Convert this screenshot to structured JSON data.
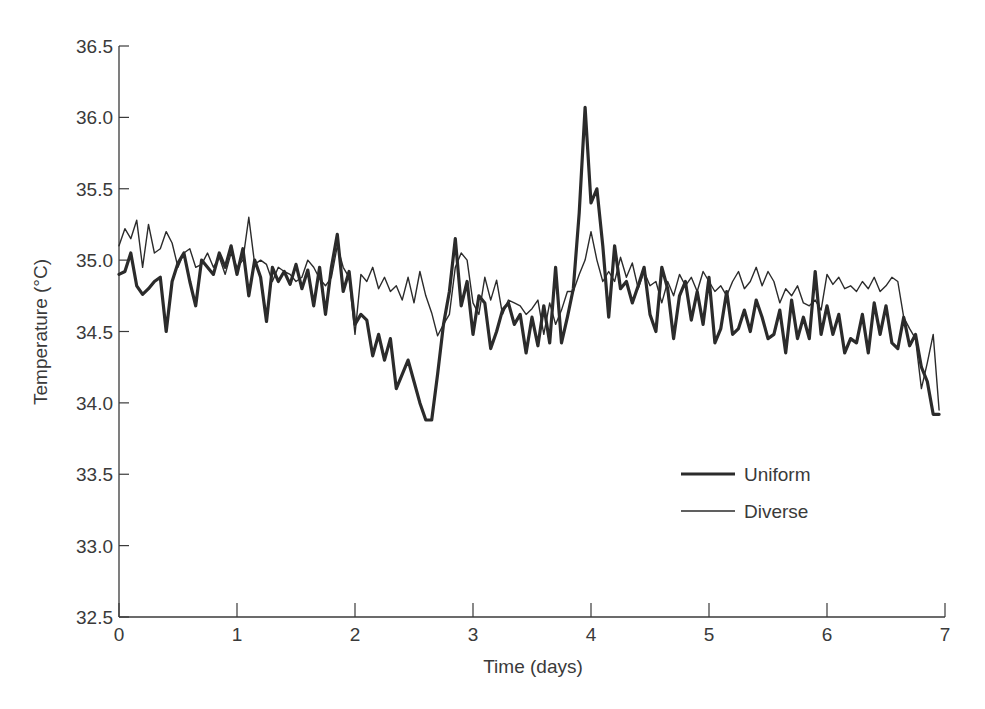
{
  "chart_data": {
    "type": "line",
    "title": "",
    "xlabel": "Time (days)",
    "ylabel": "Temperature (°C)",
    "xlim": [
      0,
      7
    ],
    "ylim": [
      32.5,
      36.5
    ],
    "xticks": [
      0,
      1,
      2,
      3,
      4,
      5,
      6,
      7
    ],
    "yticks": [
      32.5,
      33.0,
      33.5,
      34.0,
      34.5,
      35.0,
      35.5,
      36.0,
      36.5
    ],
    "ytick_labels": [
      "32.5",
      "33.0",
      "33.5",
      "34.0",
      "34.5",
      "35.0",
      "35.5",
      "36.0",
      "36.5"
    ],
    "grid": false,
    "legend_position": "lower right (inside plot)",
    "series": [
      {
        "name": "Uniform",
        "style": "thick",
        "color": "#2b2b2b",
        "x": [
          0.0,
          0.05,
          0.1,
          0.15,
          0.2,
          0.25,
          0.3,
          0.35,
          0.4,
          0.45,
          0.5,
          0.55,
          0.6,
          0.65,
          0.7,
          0.75,
          0.8,
          0.85,
          0.9,
          0.95,
          1.0,
          1.05,
          1.1,
          1.15,
          1.2,
          1.25,
          1.3,
          1.35,
          1.4,
          1.45,
          1.5,
          1.55,
          1.6,
          1.65,
          1.7,
          1.75,
          1.8,
          1.85,
          1.9,
          1.95,
          2.0,
          2.05,
          2.1,
          2.15,
          2.2,
          2.25,
          2.3,
          2.35,
          2.4,
          2.45,
          2.5,
          2.55,
          2.6,
          2.65,
          2.7,
          2.75,
          2.8,
          2.85,
          2.9,
          2.95,
          3.0,
          3.05,
          3.1,
          3.15,
          3.2,
          3.25,
          3.3,
          3.35,
          3.4,
          3.45,
          3.5,
          3.55,
          3.6,
          3.65,
          3.7,
          3.75,
          3.8,
          3.85,
          3.9,
          3.95,
          4.0,
          4.05,
          4.1,
          4.15,
          4.2,
          4.25,
          4.3,
          4.35,
          4.4,
          4.45,
          4.5,
          4.55,
          4.6,
          4.65,
          4.7,
          4.75,
          4.8,
          4.85,
          4.9,
          4.95,
          5.0,
          5.05,
          5.1,
          5.15,
          5.2,
          5.25,
          5.3,
          5.35,
          5.4,
          5.45,
          5.5,
          5.55,
          5.6,
          5.65,
          5.7,
          5.75,
          5.8,
          5.85,
          5.9,
          5.95,
          6.0,
          6.05,
          6.1,
          6.15,
          6.2,
          6.25,
          6.3,
          6.35,
          6.4,
          6.45,
          6.5,
          6.55,
          6.6,
          6.65,
          6.7,
          6.75,
          6.8,
          6.85,
          6.9,
          6.95
        ],
        "y": [
          34.9,
          34.92,
          35.05,
          34.82,
          34.76,
          34.8,
          34.85,
          34.88,
          34.5,
          34.85,
          34.98,
          35.05,
          34.85,
          34.68,
          35.0,
          34.95,
          34.9,
          35.05,
          34.95,
          35.1,
          34.9,
          35.08,
          34.75,
          35.0,
          34.88,
          34.57,
          34.95,
          34.85,
          34.92,
          34.83,
          34.97,
          34.8,
          34.93,
          34.68,
          34.95,
          34.62,
          34.95,
          35.18,
          34.78,
          34.92,
          34.55,
          34.62,
          34.58,
          34.33,
          34.48,
          34.3,
          34.45,
          34.1,
          34.2,
          34.3,
          34.15,
          34.0,
          33.88,
          33.88,
          34.2,
          34.55,
          34.78,
          35.15,
          34.68,
          34.85,
          34.48,
          34.75,
          34.7,
          34.38,
          34.5,
          34.65,
          34.7,
          34.55,
          34.62,
          34.35,
          34.6,
          34.4,
          34.68,
          34.42,
          34.95,
          34.42,
          34.6,
          34.8,
          35.33,
          36.07,
          35.4,
          35.5,
          35.1,
          34.6,
          35.1,
          34.8,
          34.85,
          34.7,
          34.82,
          34.95,
          34.62,
          34.5,
          34.95,
          34.8,
          34.45,
          34.75,
          34.85,
          34.58,
          34.78,
          34.55,
          34.88,
          34.42,
          34.52,
          34.78,
          34.48,
          34.52,
          34.65,
          34.5,
          34.72,
          34.6,
          34.45,
          34.48,
          34.65,
          34.35,
          34.72,
          34.45,
          34.6,
          34.45,
          34.92,
          34.48,
          34.68,
          34.48,
          34.62,
          34.35,
          34.45,
          34.42,
          34.62,
          34.35,
          34.7,
          34.48,
          34.68,
          34.42,
          34.38,
          34.6,
          34.4,
          34.48,
          34.25,
          34.15,
          33.92,
          33.92
        ],
        "notes": "Values traced from pixels; approximate to ±0.05 °C"
      },
      {
        "name": "Diverse",
        "style": "thin",
        "color": "#2b2b2b",
        "x": [
          0.0,
          0.05,
          0.1,
          0.15,
          0.2,
          0.25,
          0.3,
          0.35,
          0.4,
          0.45,
          0.5,
          0.55,
          0.6,
          0.65,
          0.7,
          0.75,
          0.8,
          0.85,
          0.9,
          0.95,
          1.0,
          1.05,
          1.1,
          1.15,
          1.2,
          1.25,
          1.3,
          1.35,
          1.4,
          1.45,
          1.5,
          1.55,
          1.6,
          1.65,
          1.7,
          1.75,
          1.8,
          1.85,
          1.9,
          1.95,
          2.0,
          2.05,
          2.1,
          2.15,
          2.2,
          2.25,
          2.3,
          2.35,
          2.4,
          2.45,
          2.5,
          2.55,
          2.6,
          2.65,
          2.7,
          2.75,
          2.8,
          2.85,
          2.9,
          2.95,
          3.0,
          3.05,
          3.1,
          3.15,
          3.2,
          3.25,
          3.3,
          3.35,
          3.4,
          3.45,
          3.5,
          3.55,
          3.6,
          3.65,
          3.7,
          3.75,
          3.8,
          3.85,
          3.9,
          3.95,
          4.0,
          4.05,
          4.1,
          4.15,
          4.2,
          4.25,
          4.3,
          4.35,
          4.4,
          4.45,
          4.5,
          4.55,
          4.6,
          4.65,
          4.7,
          4.75,
          4.8,
          4.85,
          4.9,
          4.95,
          5.0,
          5.05,
          5.1,
          5.15,
          5.2,
          5.25,
          5.3,
          5.35,
          5.4,
          5.45,
          5.5,
          5.55,
          5.6,
          5.65,
          5.7,
          5.75,
          5.8,
          5.85,
          5.9,
          5.95,
          6.0,
          6.05,
          6.1,
          6.15,
          6.2,
          6.25,
          6.3,
          6.35,
          6.4,
          6.45,
          6.5,
          6.55,
          6.6,
          6.65,
          6.7,
          6.75,
          6.8,
          6.85,
          6.9,
          6.95
        ],
        "y": [
          35.1,
          35.22,
          35.15,
          35.28,
          34.95,
          35.25,
          35.05,
          35.08,
          35.2,
          35.12,
          34.95,
          35.05,
          35.08,
          34.95,
          34.97,
          35.05,
          34.95,
          35.02,
          34.9,
          35.05,
          34.95,
          35.0,
          35.3,
          34.97,
          35.0,
          34.97,
          34.85,
          34.95,
          34.92,
          34.9,
          34.85,
          34.88,
          35.0,
          34.95,
          34.87,
          34.82,
          34.88,
          35.1,
          34.95,
          34.88,
          34.48,
          34.9,
          34.85,
          34.95,
          34.8,
          34.88,
          34.78,
          34.82,
          34.72,
          34.88,
          34.7,
          34.92,
          34.75,
          34.63,
          34.47,
          34.55,
          34.62,
          34.95,
          35.05,
          35.0,
          34.7,
          34.62,
          34.88,
          34.72,
          34.86,
          34.62,
          34.72,
          34.7,
          34.68,
          34.62,
          34.66,
          34.72,
          34.48,
          34.7,
          34.55,
          34.65,
          34.78,
          34.78,
          34.9,
          35.0,
          35.2,
          35.0,
          34.85,
          34.92,
          34.85,
          35.02,
          34.88,
          34.98,
          34.8,
          34.92,
          34.82,
          34.85,
          34.7,
          34.85,
          34.75,
          34.9,
          34.82,
          34.88,
          34.78,
          34.92,
          34.85,
          34.78,
          34.82,
          34.75,
          34.85,
          34.92,
          34.8,
          34.85,
          34.95,
          34.82,
          34.92,
          34.85,
          34.7,
          34.8,
          34.75,
          34.82,
          34.7,
          34.68,
          34.72,
          34.65,
          34.9,
          34.83,
          34.88,
          34.8,
          34.82,
          34.78,
          34.85,
          34.8,
          34.88,
          34.78,
          34.82,
          34.88,
          34.85,
          34.6,
          34.52,
          34.45,
          34.1,
          34.28,
          34.48,
          33.95
        ],
        "notes": "Values traced from pixels; approximate to ±0.05 °C"
      }
    ],
    "legend": [
      {
        "label": "Uniform",
        "line": "thick"
      },
      {
        "label": "Diverse",
        "line": "thin"
      }
    ]
  },
  "layout": {
    "plot_left_px": 119,
    "plot_right_px": 945,
    "plot_top_px": 46,
    "plot_bottom_px": 617,
    "axis_color": "#3a3a3a",
    "line_color": "#2b2b2b",
    "thick_width": 3.2,
    "thin_width": 1.4
  }
}
